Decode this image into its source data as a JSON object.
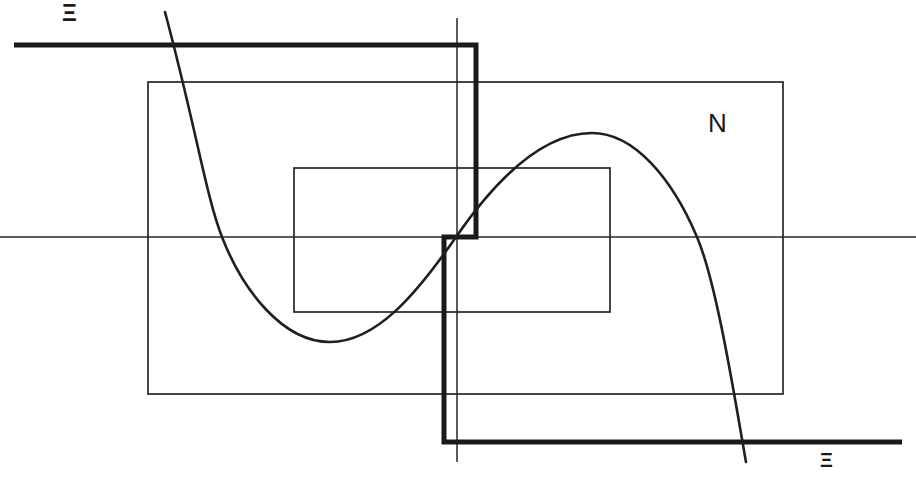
{
  "figure": {
    "canvas": {
      "width": 916,
      "height": 480,
      "background": "#ffffff"
    },
    "ink_color": "#1a1a1a",
    "labels": [
      {
        "id": "xi-top",
        "text": "Ξ",
        "x": 62,
        "y": 2,
        "size": 23,
        "weight": 600,
        "name": "axis-label-xi-top"
      },
      {
        "id": "n-right",
        "text": "N",
        "x": 708,
        "y": 110,
        "size": 26,
        "weight": 400,
        "name": "region-label-n"
      },
      {
        "id": "xi-bottom",
        "text": "Ξ",
        "x": 820,
        "y": 450,
        "size": 20,
        "weight": 600,
        "name": "axis-label-xi-bottom"
      }
    ],
    "elements": {
      "horizontal_axis": {
        "name": "horizontal-axis-line",
        "description": "thin horizontal axis spanning full width",
        "y": 237,
        "x_start": 0,
        "x_end": 916,
        "stroke_width": 1.4
      },
      "vertical_axis": {
        "name": "vertical-axis-line",
        "description": "thin vertical axis near center",
        "x": 457,
        "y_start": 18,
        "y_end": 462,
        "stroke_width": 1.4
      },
      "outer_rectangle": {
        "name": "outer-rectangle",
        "x": 148,
        "y": 82,
        "width": 635,
        "height": 312,
        "stroke_width": 1.6
      },
      "inner_rectangle": {
        "name": "inner-rectangle",
        "x": 294,
        "y": 168,
        "width": 316,
        "height": 144,
        "stroke_width": 1.6
      },
      "bold_step_path": {
        "name": "bold-step-path",
        "description": "heavy stepped polyline: left horizontal at top, drop, shift, drop, right horizontal at bottom",
        "stroke_width": 5,
        "points": [
          {
            "x": 14,
            "y": 45
          },
          {
            "x": 476,
            "y": 45
          },
          {
            "x": 476,
            "y": 237
          },
          {
            "x": 444,
            "y": 237
          },
          {
            "x": 444,
            "y": 442
          },
          {
            "x": 902,
            "y": 442
          }
        ]
      },
      "sigmoid_curve": {
        "name": "cubic-curve",
        "description": "S-shaped cubic curve entering top-left, minimum, zero crossing at origin, maximum, exiting bottom-right",
        "stroke_width": 2.6,
        "key_points": [
          {
            "label": "entry-top",
            "x": 165,
            "y": 12
          },
          {
            "label": "axis-crossing-1",
            "x": 222,
            "y": 237
          },
          {
            "label": "minimum",
            "x": 330,
            "y": 342
          },
          {
            "label": "axis-crossing-2",
            "x": 456,
            "y": 237
          },
          {
            "label": "maximum",
            "x": 592,
            "y": 133
          },
          {
            "label": "axis-crossing-3",
            "x": 697,
            "y": 237
          },
          {
            "label": "exit-bottom",
            "x": 746,
            "y": 462
          }
        ]
      }
    }
  }
}
